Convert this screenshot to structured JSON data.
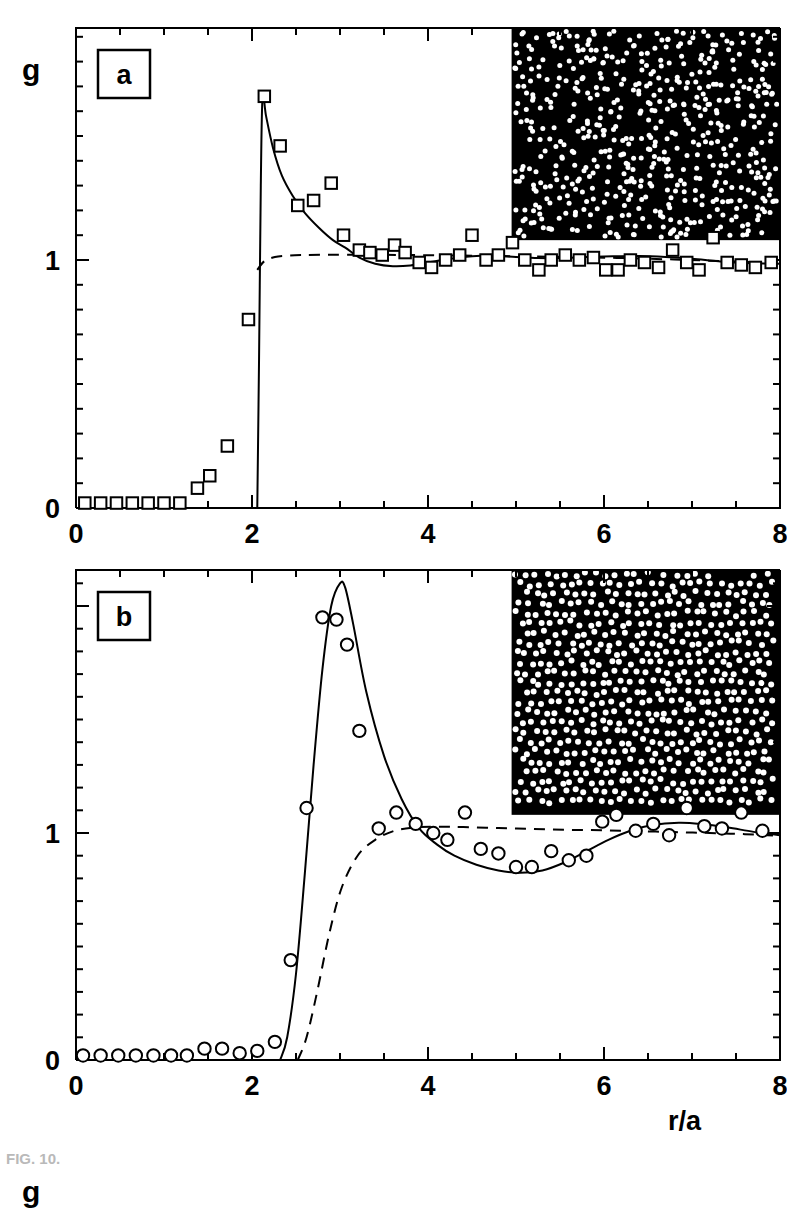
{
  "figure": {
    "caption": "FIG. 10.",
    "y_axis_label": "g",
    "x_axis_label": "r/a"
  },
  "panels": [
    {
      "tag": "a",
      "marker": "square",
      "xticklabels": [
        "0",
        "2",
        "4",
        "6",
        "8"
      ],
      "yticklabels": [
        "0",
        "1"
      ]
    },
    {
      "tag": "b",
      "marker": "circle",
      "xticklabels": [
        "0",
        "2",
        "4",
        "6",
        "8"
      ],
      "yticklabels": [
        "0",
        "1"
      ]
    }
  ],
  "chart_data": [
    {
      "type": "scatter",
      "panel": "a",
      "title": "",
      "xlabel": "r/a",
      "ylabel": "g",
      "xlim": [
        0,
        8
      ],
      "ylim": [
        0,
        2.1
      ],
      "xticks": [
        0,
        2,
        4,
        6,
        8
      ],
      "yticks": [
        0,
        1
      ],
      "minor_tick_step_x": 0.5,
      "minor_tick_step_y": 0.1,
      "grid": false,
      "legend": "none",
      "annotation": "a",
      "inset": {
        "description": "black square field with white dots, disordered gas-like particle configuration",
        "background_color": "#000000",
        "dot_color": "#ffffff",
        "n_dots": 560,
        "arrangement": "random",
        "x_range_fig": [
          4.95,
          8.0
        ],
        "y_range_fig": [
          1.08,
          2.1
        ]
      },
      "series": [
        {
          "name": "measured g(r) squares",
          "style": "open-square-markers",
          "x": [
            0.1,
            0.28,
            0.46,
            0.64,
            0.82,
            1.0,
            1.18,
            1.38,
            1.52,
            1.72,
            1.96,
            2.14,
            2.32,
            2.52,
            2.7,
            2.9,
            3.04,
            3.22,
            3.34,
            3.48,
            3.62,
            3.74,
            3.9,
            4.04,
            4.2,
            4.36,
            4.5,
            4.66,
            4.8,
            4.96,
            5.1,
            5.26,
            5.4,
            5.56,
            5.72,
            5.88,
            6.02,
            6.16,
            6.3,
            6.46,
            6.62,
            6.78,
            6.94,
            7.08,
            7.24,
            7.4,
            7.56,
            7.72,
            7.9
          ],
          "y": [
            0.02,
            0.02,
            0.02,
            0.02,
            0.02,
            0.02,
            0.02,
            0.08,
            0.13,
            0.25,
            0.76,
            1.66,
            1.46,
            1.22,
            1.24,
            1.31,
            1.1,
            1.04,
            1.03,
            1.02,
            1.06,
            1.03,
            0.99,
            0.97,
            1.0,
            1.02,
            1.1,
            1.0,
            1.02,
            1.07,
            1.0,
            0.96,
            1.0,
            1.02,
            1.0,
            1.01,
            0.96,
            0.96,
            1.0,
            0.99,
            0.97,
            1.04,
            0.99,
            0.96,
            1.09,
            0.99,
            0.98,
            0.97,
            0.99
          ]
        },
        {
          "name": "theory solid curve",
          "style": "solid-line",
          "x": [
            2.06,
            2.08,
            2.1,
            2.12,
            2.16,
            2.24,
            2.34,
            2.46,
            2.6,
            2.76,
            2.92,
            3.06,
            3.22,
            3.4,
            3.6,
            3.8,
            4.0,
            4.2,
            4.4,
            4.6,
            4.8,
            5.0,
            5.25,
            5.5,
            5.8,
            6.1,
            6.4,
            6.7,
            7.0,
            7.3,
            7.6,
            8.0
          ],
          "y": [
            0.0,
            0.6,
            1.3,
            1.66,
            1.58,
            1.45,
            1.34,
            1.26,
            1.19,
            1.13,
            1.08,
            1.05,
            1.01,
            0.985,
            0.975,
            0.978,
            0.99,
            1.002,
            1.012,
            1.017,
            1.016,
            1.012,
            1.008,
            1.008,
            1.012,
            1.015,
            1.016,
            1.012,
            1.005,
            0.995,
            0.988,
            0.985
          ]
        },
        {
          "name": "reference dashed curve",
          "style": "dashed-line",
          "x": [
            2.06,
            2.14,
            2.26,
            2.42,
            2.6,
            2.9,
            3.3,
            3.8,
            4.4,
            5.0,
            5.6,
            6.2,
            6.8,
            7.4,
            8.0
          ],
          "y": [
            0.96,
            0.995,
            1.012,
            1.018,
            1.02,
            1.021,
            1.021,
            1.02,
            1.018,
            1.015,
            1.012,
            1.008,
            1.002,
            0.995,
            0.988
          ]
        }
      ]
    },
    {
      "type": "scatter",
      "panel": "b",
      "title": "",
      "xlabel": "r/a",
      "ylabel": "g",
      "xlim": [
        0,
        8
      ],
      "ylim": [
        0,
        2.1
      ],
      "xticks": [
        0,
        2,
        4,
        6,
        8
      ],
      "yticks": [
        0,
        1
      ],
      "minor_tick_step_x": 0.5,
      "minor_tick_step_y": 0.1,
      "grid": false,
      "legend": "none",
      "annotation": "b",
      "inset": {
        "description": "black square field with white dots, ordered liquid-like particle configuration with uniform spacing",
        "background_color": "#000000",
        "dot_color": "#ffffff",
        "n_dots": 620,
        "arrangement": "liquid-like",
        "x_range_fig": [
          4.95,
          8.0
        ],
        "y_range_fig": [
          1.08,
          2.1
        ]
      },
      "series": [
        {
          "name": "measured g(r) circles",
          "style": "open-circle-markers",
          "x": [
            0.08,
            0.28,
            0.48,
            0.68,
            0.88,
            1.08,
            1.26,
            1.46,
            1.66,
            1.86,
            2.06,
            2.26,
            2.44,
            2.62,
            2.8,
            2.96,
            3.08,
            3.22,
            3.44,
            3.64,
            3.86,
            4.06,
            4.22,
            4.42,
            4.6,
            4.8,
            5.0,
            5.18,
            5.4,
            5.6,
            5.8,
            5.98,
            6.14,
            6.36,
            6.56,
            6.74,
            6.94,
            7.14,
            7.34,
            7.56,
            7.8
          ],
          "y": [
            0.02,
            0.02,
            0.02,
            0.02,
            0.02,
            0.02,
            0.02,
            0.05,
            0.05,
            0.03,
            0.04,
            0.08,
            0.44,
            1.11,
            1.95,
            1.94,
            1.83,
            1.45,
            1.02,
            1.09,
            1.04,
            1.0,
            0.97,
            1.09,
            0.93,
            0.91,
            0.85,
            0.85,
            0.92,
            0.88,
            0.9,
            1.05,
            1.08,
            1.01,
            1.04,
            0.99,
            1.11,
            1.03,
            1.02,
            1.09,
            1.01
          ]
        },
        {
          "name": "theory solid curve",
          "style": "solid-line",
          "x": [
            2.32,
            2.4,
            2.5,
            2.6,
            2.7,
            2.8,
            2.9,
            3.0,
            3.06,
            3.15,
            3.3,
            3.5,
            3.7,
            3.9,
            4.1,
            4.3,
            4.55,
            4.8,
            5.05,
            5.3,
            5.55,
            5.8,
            6.05,
            6.3,
            6.55,
            6.85,
            7.1,
            7.4,
            7.7,
            8.0
          ],
          "y": [
            0.0,
            0.1,
            0.38,
            0.82,
            1.3,
            1.72,
            2.0,
            2.1,
            2.08,
            1.92,
            1.62,
            1.34,
            1.15,
            1.02,
            0.95,
            0.9,
            0.86,
            0.835,
            0.825,
            0.835,
            0.87,
            0.92,
            0.97,
            1.01,
            1.035,
            1.045,
            1.04,
            1.025,
            1.005,
            0.99
          ]
        },
        {
          "name": "reference dashed curve",
          "style": "dashed-line",
          "x": [
            2.52,
            2.62,
            2.74,
            2.88,
            3.02,
            3.2,
            3.4,
            3.62,
            3.86,
            4.1,
            4.4,
            4.8,
            5.2,
            5.6,
            6.0,
            6.4,
            6.8,
            7.2,
            7.6,
            8.0
          ],
          "y": [
            0.0,
            0.1,
            0.3,
            0.56,
            0.76,
            0.9,
            0.97,
            1.01,
            1.025,
            1.028,
            1.026,
            1.022,
            1.018,
            1.014,
            1.012,
            1.008,
            1.004,
            1.0,
            0.995,
            0.988
          ]
        }
      ]
    }
  ]
}
